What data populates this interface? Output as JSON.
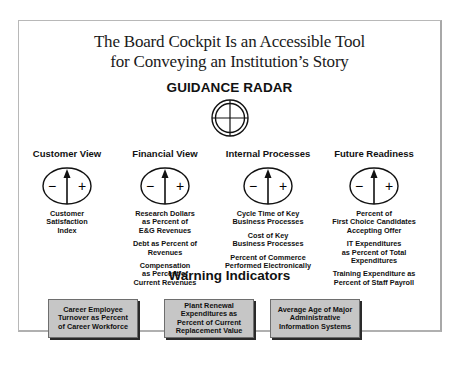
{
  "figure": {
    "title_lines": [
      "The Board Cockpit Is an Accessible Tool",
      "for Conveying an Institution’s Story"
    ],
    "guidance_radar_label": "GUIDANCE RADAR",
    "gauge_symbols": {
      "minus": "−",
      "plus": "+"
    },
    "columns": [
      {
        "heading": "Customer View",
        "metrics": [
          "Customer\nSatisfaction\nIndex"
        ]
      },
      {
        "heading": "Financial View",
        "metrics": [
          "Research Dollars\nas Percent of\nE&G Revenues",
          "Debt as Percent of\nRevenues",
          "Compensation\nas Percent of\nCurrent Revenues"
        ]
      },
      {
        "heading": "Internal Processes",
        "metrics": [
          "Cycle Time of Key\nBusiness Processes",
          "Cost of Key\nBusiness Processes",
          "Percent of Commerce\nPerformed Electronically"
        ]
      },
      {
        "heading": "Future Readiness",
        "metrics": [
          "Percent of\nFirst Choice Candidates\nAccepting Offer",
          "IT Expenditures\nas Percent of Total\nExpenditures",
          "Training Expenditure as\nPercent of Staff Payroll"
        ]
      }
    ],
    "warning_label": "Warning Indicators",
    "warning_boxes": [
      "Career Employee\nTurnover as Percent\nof Career Workforce",
      "Plant Renewal\nExpenditures as\nPercent of Current\nReplacement Value",
      "Average Age of Major\nAdministrative\nInformation Systems"
    ],
    "colors": {
      "warning_box_fill": "#c6c6c6",
      "warning_box_shadow": "#2a2a2a",
      "frame_border": "#b8b8b8",
      "ink": "#111111"
    }
  }
}
